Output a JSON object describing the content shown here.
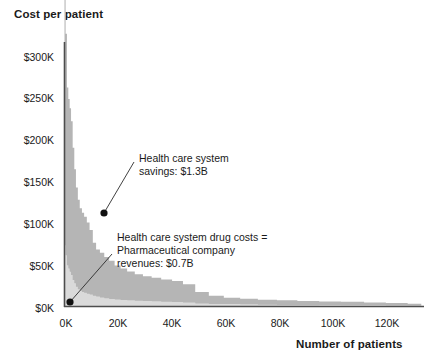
{
  "chart_data": {
    "type": "area",
    "title": "Cost per patient",
    "subtitle": "",
    "xlabel": "Number of patients",
    "ylabel": "Cost per patient",
    "xlim": [
      0,
      132000
    ],
    "ylim": [
      0,
      320000
    ],
    "grid": false,
    "legend_position": "none",
    "x_tick_labels": [
      "0K",
      "20K",
      "40K",
      "60K",
      "80K",
      "100K",
      "120K"
    ],
    "x_tick_values": [
      0,
      20000,
      40000,
      60000,
      80000,
      100000,
      120000
    ],
    "y_tick_labels": [
      "$0K",
      "$50K",
      "$100K",
      "$150K",
      "$200K",
      "$250K",
      "$300K"
    ],
    "y_tick_values": [
      0,
      50000,
      100000,
      150000,
      200000,
      250000,
      300000
    ],
    "series": [
      {
        "name": "Health care system savings",
        "color": "#b5b5b5",
        "stacked_order": "top",
        "x": [
          0,
          400,
          900,
          1400,
          1900,
          2400,
          3000,
          3600,
          4200,
          4900,
          5600,
          6400,
          7200,
          8200,
          9200,
          10400,
          11600,
          13000,
          14600,
          16400,
          18400,
          20600,
          23000,
          25800,
          28800,
          32000,
          35500,
          39500,
          43500,
          48000,
          53000,
          58500,
          64500,
          71000,
          78000,
          85500,
          93500,
          101500,
          110000,
          118000,
          126000,
          131000
        ],
        "y": [
          312000,
          268000,
          215000,
          205000,
          198000,
          186000,
          160000,
          138000,
          120000,
          108000,
          100000,
          96000,
          92000,
          86000,
          78000,
          64000,
          57000,
          54000,
          50000,
          46000,
          41000,
          38000,
          35000,
          32000,
          30000,
          28500,
          27000,
          25500,
          22000,
          14000,
          10000,
          8000,
          7000,
          6200,
          5600,
          5000,
          4600,
          4200,
          3600,
          3000,
          2400,
          2000
        ]
      },
      {
        "name": "Health care system drug costs = Pharmaceutical company revenues",
        "color": "#dadada",
        "stacked_order": "bottom",
        "x": [
          0,
          400,
          900,
          1400,
          1900,
          2400,
          3000,
          3600,
          4200,
          4900,
          5600,
          6400,
          7200,
          8200,
          9200,
          10400,
          11600,
          13000,
          14600,
          16400,
          18400,
          20600,
          23000,
          25800,
          28800,
          32000,
          35500,
          39500,
          43500,
          48000,
          53000,
          58500,
          64500,
          71000,
          78000,
          85500,
          93500,
          101500,
          110000,
          118000,
          126000,
          131000
        ],
        "y": [
          74000,
          62000,
          50000,
          46000,
          42000,
          38000,
          32000,
          28000,
          24000,
          21000,
          19000,
          17500,
          16500,
          15500,
          14500,
          13000,
          12000,
          11000,
          10000,
          9200,
          8600,
          8000,
          7400,
          7000,
          6600,
          6200,
          5800,
          5400,
          4800,
          3600,
          3000,
          2600,
          2300,
          2100,
          1900,
          1700,
          1550,
          1400,
          1250,
          1100,
          950,
          800
        ]
      }
    ],
    "annotations": [
      {
        "name": "savings-annotation",
        "lines": "Health care system\nsavings: $1.3B",
        "text_x": 139,
        "text_y": 152,
        "dot_x": 104,
        "dot_y": 213,
        "leader_from_x": 134,
        "leader_from_y": 162
      },
      {
        "name": "drug-costs-annotation",
        "lines": "Health care system drug costs =\nPharmaceutical company\nrevenues: $0.7B",
        "text_x": 117,
        "text_y": 231,
        "dot_x": 70,
        "dot_y": 302,
        "leader_from_x": 112,
        "leader_from_y": 254
      }
    ],
    "colors": {
      "savings_fill": "#b5b5b5",
      "drug_costs_fill": "#dadada",
      "axis": "#4d4d4d",
      "text": "#1a1a1a",
      "marker": "#111111"
    }
  },
  "axes": {
    "y_ticks": [
      {
        "label": "$300K",
        "top": 51
      },
      {
        "label": "$250K",
        "top": 92
      },
      {
        "label": "$200K",
        "top": 134
      },
      {
        "label": "$150K",
        "top": 176
      },
      {
        "label": "$100K",
        "top": 218
      },
      {
        "label": "$50K",
        "top": 260
      },
      {
        "label": "$0K",
        "top": 302
      }
    ],
    "x_ticks": [
      {
        "label": "0K",
        "left": 44
      },
      {
        "label": "20K",
        "left": 96
      },
      {
        "label": "40K",
        "left": 150
      },
      {
        "label": "60K",
        "left": 204
      },
      {
        "label": "80K",
        "left": 258
      },
      {
        "label": "100K",
        "left": 311
      },
      {
        "label": "120K",
        "left": 365
      }
    ]
  },
  "header": {
    "title": "Cost per patient"
  },
  "footer": {
    "x_axis_title": "Number of patients"
  }
}
